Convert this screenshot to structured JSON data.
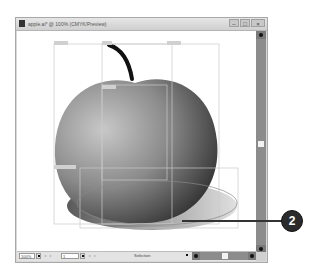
{
  "window": {
    "title": "apple.ai* @ 100% (CMYK/Preview)",
    "controls": {
      "minimize": "–",
      "maximize": "□",
      "close": "×"
    }
  },
  "statusbar": {
    "zoom": "100%",
    "page": "1",
    "nav_prev": "◂ ◂",
    "nav_next": "▸ ▸",
    "tool_status": "Selection"
  },
  "canvas": {
    "artwork": "apple-with-stem-and-shadow",
    "colors": {
      "apple_light": "#b8b8b8",
      "apple_dark": "#2a2a2a",
      "stem": "#111111",
      "guide": "#c8c8c8"
    }
  },
  "callout": {
    "number": "2"
  }
}
